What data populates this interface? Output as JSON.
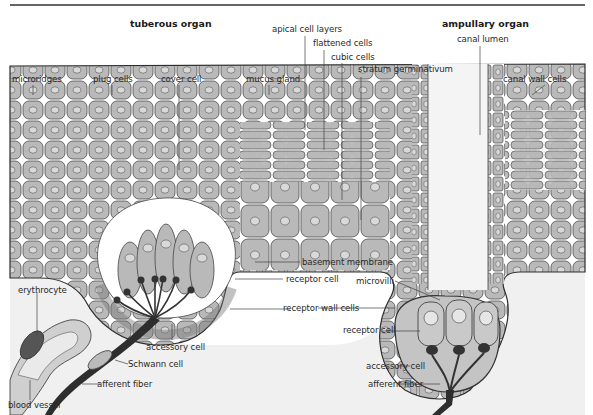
{
  "figure": {
    "titles": {
      "tuberous": "tuberous organ",
      "ampullary": "ampullary organ"
    },
    "labels": {
      "microridges": "microridges",
      "plug_cells": "plug cells",
      "cover_cell": "cover cell",
      "mucus_gland": "mucus gland",
      "apical_cell_layers": "apical cell layers",
      "flattened_cells": "flattened cells",
      "cubic_cells": "cubic cells",
      "stratum_germinativum": "stratum germinativum",
      "canal_lumen": "canal lumen",
      "canal_wall_cells": "canal wall cells",
      "basement_membrane": "basement membrane",
      "receptor_cell_tuberous": "receptor cell",
      "microvilli": "microvilli",
      "receptor_wall_cells": "receptor wall cells",
      "receptor_cell_ampullary": "receptor cell",
      "erythrocyte": "erythrocyte",
      "accessory_cell_tuberous": "accessory cell",
      "accessory_cell_ampullary": "accessory cell",
      "schwann_cell": "Schwann cell",
      "afferent_fiber_tuberous": "afferent fiber",
      "afferent_fiber_ampullary": "afferent fiber",
      "blood_vessel": "blood vessel"
    },
    "colors": {
      "cell_fill": "#b9b9b9",
      "nucleus_fill": "#d9d9d9",
      "outline": "#3a3a3a",
      "dermis_fill": "#efefef",
      "nerve_fill": "#2e2e2e",
      "lumen_fill": "#f4f4f4"
    }
  }
}
